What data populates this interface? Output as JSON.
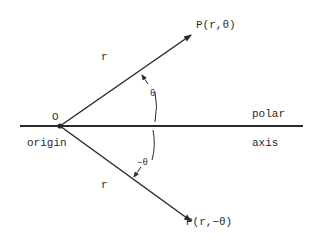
{
  "diagram": {
    "point_upper": "P(r,θ)",
    "point_lower": "P(r,−θ)",
    "radius_upper": "r",
    "radius_lower": "r",
    "angle_upper": "θ",
    "angle_lower": "−θ",
    "origin_letter": "O",
    "origin_label": "origin",
    "axis_label_top": "polar",
    "axis_label_bottom": "axis"
  }
}
